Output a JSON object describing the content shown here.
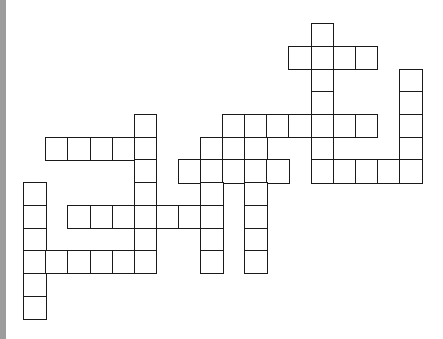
{
  "colors": {
    "background": "#ffffff",
    "cell_border": "#1a1a1a",
    "cell_fill": "#ffffff",
    "left_strip": "#9c9c9c"
  },
  "puzzle": {
    "type": "crossword-grid",
    "origin_x": 24,
    "origin_y": 24,
    "cell_width": 22.1,
    "cell_height": 22.7,
    "rows": [
      {
        "row": 0,
        "cols": [
          13
        ]
      },
      {
        "row": 1,
        "cols": [
          12,
          13,
          14,
          15
        ]
      },
      {
        "row": 2,
        "cols": [
          13,
          17
        ]
      },
      {
        "row": 3,
        "cols": [
          13,
          17
        ]
      },
      {
        "row": 4,
        "cols": [
          5,
          9,
          10,
          11,
          12,
          13,
          14,
          15,
          17
        ]
      },
      {
        "row": 5,
        "cols": [
          1,
          2,
          3,
          4,
          5,
          8,
          9,
          10,
          13,
          17
        ]
      },
      {
        "row": 6,
        "cols": [
          5,
          7,
          8,
          9,
          10,
          11,
          13,
          14,
          15,
          16,
          17
        ]
      },
      {
        "row": 7,
        "cols": [
          0,
          5,
          8,
          10
        ]
      },
      {
        "row": 8,
        "cols": [
          0,
          2,
          3,
          4,
          5,
          6,
          7,
          8,
          10
        ]
      },
      {
        "row": 9,
        "cols": [
          0,
          5,
          8,
          10
        ]
      },
      {
        "row": 10,
        "cols": [
          0,
          1,
          2,
          3,
          4,
          5,
          8,
          10
        ]
      },
      {
        "row": 11,
        "cols": [
          0
        ]
      },
      {
        "row": 12,
        "cols": [
          0
        ]
      }
    ]
  }
}
